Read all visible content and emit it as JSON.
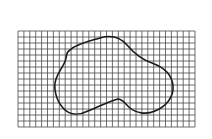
{
  "diagram": {
    "grid": {
      "x": 18,
      "y": 31,
      "width": 177,
      "height": 96,
      "columns": 30,
      "rows": 16,
      "line_color": "#4a4a4a"
    },
    "shape": {
      "stroke_color": "#1a1a1a",
      "stroke_width": 1.6,
      "path": "M 70 50 C 76 44, 90 41, 100 38 C 110 35, 120 37, 127 45 C 133 52, 140 59, 152 63 C 163 67, 172 73, 173 86 C 174 98, 165 107, 155 111 C 146 115, 136 113, 130 108 C 125 104, 123 99, 118 99 C 110 101, 98 107, 88 111 C 80 115, 70 116, 63 108 C 56 100, 53 88, 56 79 C 59 70, 65 65, 66 58 C 67 53, 67 52, 70 50 Z"
    }
  }
}
